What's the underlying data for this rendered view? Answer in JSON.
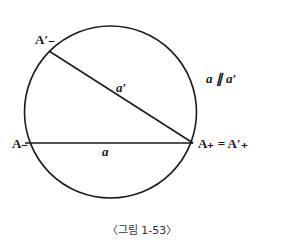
{
  "figure": {
    "caption": "〈그림 1-53〉",
    "labels": {
      "a_prime_minus": "A′₋",
      "a_minus": "A₋",
      "a_plus_eq": "A₊ = A′₊",
      "chord_a": "a",
      "chord_a_prime": "a′",
      "parallel": "a ∥ a′"
    },
    "colors": {
      "stroke": "#1a1a1a",
      "background": "#ffffff"
    }
  }
}
